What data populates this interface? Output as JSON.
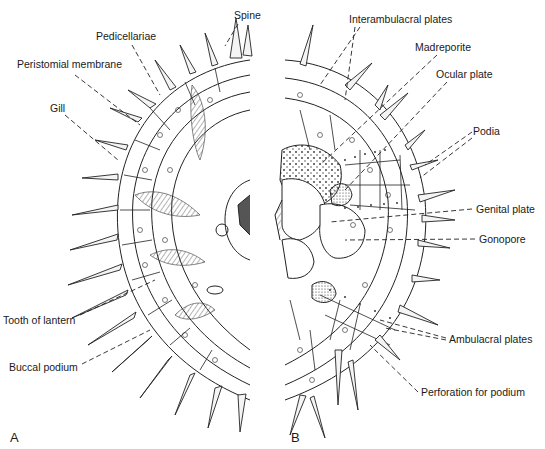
{
  "figure": {
    "panels": [
      {
        "id": "A",
        "label": "A",
        "description": "Aboral/oral half view with spines, gills, pedicellariae"
      },
      {
        "id": "B",
        "label": "B",
        "description": "Half view with test plates, spines partly removed"
      }
    ],
    "labels_left": [
      {
        "text": "Spine",
        "x": 234,
        "y": 10
      },
      {
        "text": "Pedicellariae",
        "x": 96,
        "y": 31
      },
      {
        "text": "Peristomial membrane",
        "x": 17,
        "y": 59
      },
      {
        "text": "Gill",
        "x": 50,
        "y": 103
      },
      {
        "text": "Tooth of lantern",
        "x": 3,
        "y": 315
      },
      {
        "text": "Buccal podium",
        "x": 9,
        "y": 362
      }
    ],
    "labels_right": [
      {
        "text": "Interambulacral plates",
        "x": 349,
        "y": 14
      },
      {
        "text": "Madreporite",
        "x": 415,
        "y": 42
      },
      {
        "text": "Ocular plate",
        "x": 436,
        "y": 69
      },
      {
        "text": "Podia",
        "x": 473,
        "y": 126
      },
      {
        "text": "Genital plate",
        "x": 476,
        "y": 204
      },
      {
        "text": "Gonopore",
        "x": 479,
        "y": 234
      },
      {
        "text": "Ambulacral plates",
        "x": 449,
        "y": 334
      },
      {
        "text": "Perforation for podium",
        "x": 421,
        "y": 387
      }
    ],
    "panel_letters": [
      {
        "text": "A",
        "x": 10,
        "y": 430
      },
      {
        "text": "B",
        "x": 291,
        "y": 430
      }
    ]
  }
}
